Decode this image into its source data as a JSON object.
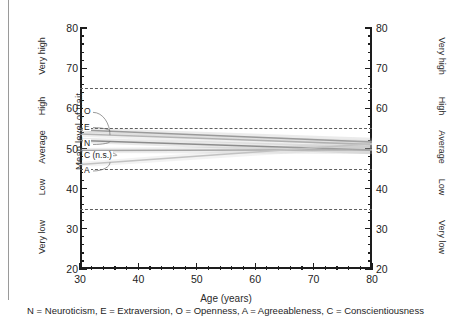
{
  "chart_data": {
    "type": "line",
    "title": "",
    "xlabel": "Age (years)",
    "ylabel": "Mean level of trait",
    "xlim": [
      30,
      80
    ],
    "ylim": [
      20,
      80
    ],
    "xticks": [
      30,
      40,
      50,
      60,
      70,
      80
    ],
    "yticks": [
      20,
      30,
      40,
      50,
      60,
      70,
      80
    ],
    "grid": "horizontal-dashed",
    "gridlines": [
      65,
      55,
      45,
      35
    ],
    "legend_position": "inline-labels",
    "band_labels_left": [
      "Very high",
      "High",
      "Average",
      "Low",
      "Very low"
    ],
    "band_labels_right": [
      "Very high",
      "High",
      "Average",
      "Low",
      "Very low"
    ],
    "bands": [
      {
        "label": "Very high",
        "range": [
          65,
          80
        ]
      },
      {
        "label": "High",
        "range": [
          55,
          65
        ]
      },
      {
        "label": "Average",
        "range": [
          45,
          55
        ]
      },
      {
        "label": "Low",
        "range": [
          35,
          45
        ]
      },
      {
        "label": "Very low",
        "range": [
          20,
          35
        ]
      }
    ],
    "x": [
      30,
      80
    ],
    "series": [
      {
        "name": "O",
        "label": "O",
        "values": [
          53.6,
          51.0
        ],
        "color": "#b4b4b4"
      },
      {
        "name": "E",
        "label": "E",
        "values": [
          54.6,
          51.6
        ],
        "color": "#9a9a9a"
      },
      {
        "name": "N",
        "label": "N",
        "values": [
          52.0,
          49.6
        ],
        "color": "#8c8c8c"
      },
      {
        "name": "C",
        "label": "C (n.s.)",
        "values": [
          49.5,
          49.7
        ],
        "color": "#a5a5a5"
      },
      {
        "name": "A",
        "label": "A",
        "values": [
          46.0,
          51.2
        ],
        "color": "#c2c2c2"
      }
    ]
  },
  "caption": {
    "text": "N = Neuroticism, E = Extraversion, O = Openness, A = Agreeableness, C = Conscientiousness"
  },
  "axis": {
    "x_label": "Age (years)",
    "y_label": "Mean level of trait"
  }
}
